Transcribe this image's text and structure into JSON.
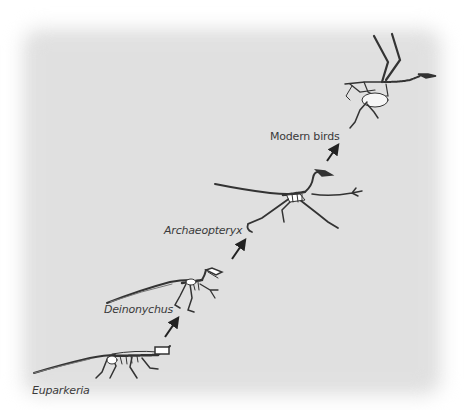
{
  "diagram": {
    "type": "evolutionary-sequence",
    "background_color": "#e2e2e2",
    "stages": [
      {
        "id": "euparkeria",
        "label": "Euparkeria",
        "italic": true
      },
      {
        "id": "deinonychus",
        "label": "Deinonychus",
        "italic": true
      },
      {
        "id": "archaeopteryx",
        "label": "Archaeopteryx",
        "italic": true
      },
      {
        "id": "modern-birds",
        "label": "Modern birds",
        "italic": false
      }
    ],
    "arrows": [
      {
        "from": "euparkeria",
        "to": "deinonychus"
      },
      {
        "from": "deinonychus",
        "to": "archaeopteryx"
      },
      {
        "from": "archaeopteryx",
        "to": "modern-birds"
      }
    ]
  }
}
